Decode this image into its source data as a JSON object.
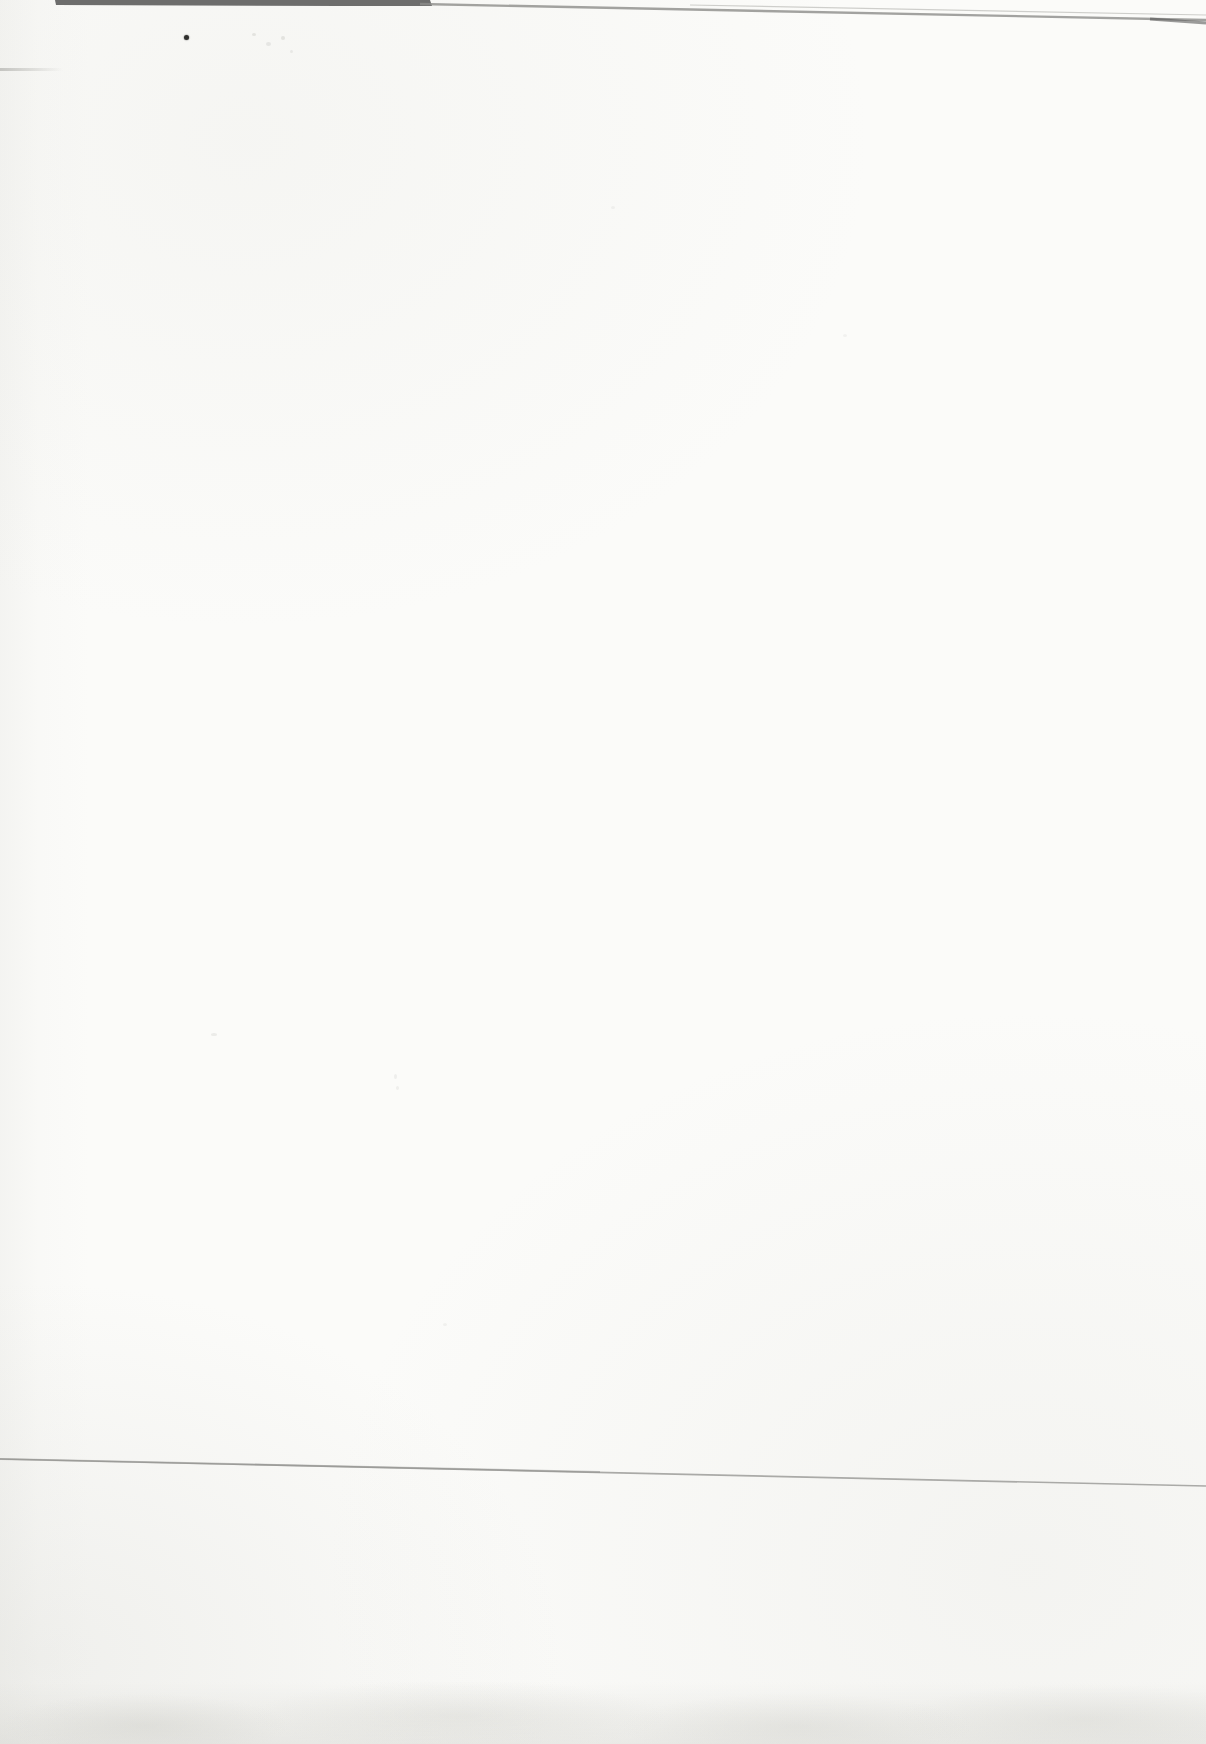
{
  "document": {
    "type": "scanned-blank-page",
    "page_text": "",
    "notes": "Blank scanned book page; no printed text or UI content visible, only scanning artifacts (top scanner edge band, ink dot, faint crease line, bottom edge mottling).",
    "colors": {
      "paper": "#fbfbf9",
      "paper_shade": "#efefec",
      "scan_edge_dark": "#4e4e4e",
      "scan_edge_mid": "#8d8d8a",
      "scan_edge_faint": "#bcbcb8",
      "crease_line": "#9d9d9a",
      "ink_dot": "#2f2f2d",
      "smudge": "#b5b5b0"
    }
  }
}
